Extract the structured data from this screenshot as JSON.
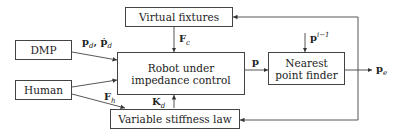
{
  "diagram": {
    "blocks": {
      "virtual_fixtures": "Virtual fixtures",
      "dmp": "DMP",
      "robot_line1": "Robot under",
      "robot_line2": "impedance control",
      "nearest_line1": "Nearest",
      "nearest_line2": "point finder",
      "human": "Human",
      "variable_stiffness": "Variable stiffness law"
    },
    "signals": {
      "pd_main": "p",
      "pd_sub": "d",
      "pd_sep": ", ",
      "pd_dot_main": "ṗ",
      "pd_dot_sub": "d",
      "fc_main": "F",
      "fc_sub": "c",
      "p": "p",
      "p_prev_main": "p",
      "p_prev_sup": "i−1",
      "pe_main": "p",
      "pe_sub": "e",
      "fh_main": "F",
      "fh_sub": "h",
      "kd_main": "K",
      "kd_sub": "d"
    }
  }
}
